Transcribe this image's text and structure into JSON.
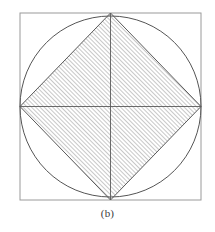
{
  "figure": {
    "caption": "(b)",
    "background_color": "#ffffff",
    "outer_square": {
      "name": "outer-square",
      "x": 20,
      "y": 13,
      "width": 181,
      "height": 187,
      "stroke_color": "#9a9a9a",
      "stroke_width": 1,
      "fill": "none"
    },
    "inscribed_circle": {
      "name": "inscribed-circle",
      "cx": 110.5,
      "cy": 106.5,
      "r": 90.5,
      "stroke_color": "#555555",
      "stroke_width": 1,
      "fill": "none"
    },
    "inscribed_diamond": {
      "name": "inscribed-diamond",
      "points": "110.5,13 201,106.5 110.5,200 20,106.5",
      "stroke_color": "#5a5a5a",
      "stroke_width": 1,
      "fill": "hatch-45",
      "hatch": {
        "angle_deg": 45,
        "direction": "lower-left-to-upper-right",
        "spacing": 3,
        "line_color": "#6e6e6e",
        "line_width": 0.7
      }
    },
    "diagonals": [
      {
        "name": "vertical-diagonal",
        "x1": 110.5,
        "y1": 13,
        "x2": 110.5,
        "y2": 200,
        "stroke_color": "#5a5a5a",
        "stroke_width": 0.9
      },
      {
        "name": "horizontal-diagonal",
        "x1": 20,
        "y1": 106.5,
        "x2": 201,
        "y2": 106.5,
        "stroke_color": "#5a5a5a",
        "stroke_width": 0.9
      }
    ]
  }
}
